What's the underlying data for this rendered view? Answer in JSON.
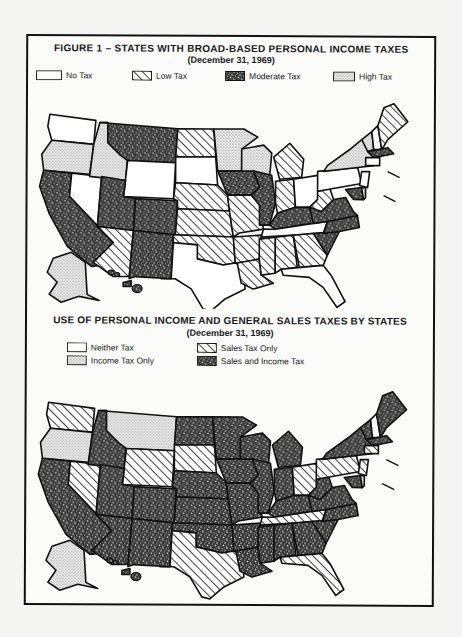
{
  "figure1": {
    "title": "FIGURE 1 – STATES WITH BROAD-BASED PERSONAL INCOME TAXES",
    "subtitle": "(December 31, 1969)",
    "legend": [
      {
        "key": "none",
        "label": "No Tax"
      },
      {
        "key": "low",
        "label": "Low Tax"
      },
      {
        "key": "moderate",
        "label": "Moderate Tax"
      },
      {
        "key": "high",
        "label": "High Tax"
      }
    ],
    "states": {
      "WA": "none",
      "OR": "high",
      "CA": "moderate",
      "NV": "none",
      "ID": "high",
      "MT": "moderate",
      "WY": "none",
      "UT": "moderate",
      "CO": "moderate",
      "AZ": "low",
      "NM": "moderate",
      "ND": "low",
      "SD": "none",
      "NE": "low",
      "KS": "low",
      "OK": "low",
      "TX": "none",
      "MN": "high",
      "IA": "moderate",
      "MO": "low",
      "AR": "low",
      "LA": "low",
      "WI": "high",
      "IL": "moderate",
      "MI": "low",
      "IN": "low",
      "OH": "none",
      "KY": "moderate",
      "TN": "none",
      "MS": "low",
      "AL": "low",
      "GA": "low",
      "FL": "none",
      "SC": "moderate",
      "NC": "moderate",
      "VA": "moderate",
      "WV": "low",
      "PA": "none",
      "NY": "high",
      "VT": "high",
      "NH": "none",
      "ME": "low",
      "MA": "moderate",
      "CT": "none",
      "NJ": "none",
      "DE": "high",
      "MD": "moderate",
      "AK": "high",
      "HI": "moderate"
    }
  },
  "figure2": {
    "title": "USE OF PERSONAL INCOME AND GENERAL SALES TAXES BY STATES",
    "subtitle": "(December 31, 1969)",
    "legend": [
      {
        "key": "none",
        "label": "Neither Tax"
      },
      {
        "key": "income",
        "label": "Income Tax Only"
      },
      {
        "key": "sales",
        "label": "Sales Tax Only"
      },
      {
        "key": "both",
        "label": "Sales and Income Tax"
      }
    ],
    "states": {
      "WA": "sales",
      "OR": "income",
      "CA": "both",
      "NV": "sales",
      "ID": "both",
      "MT": "income",
      "WY": "sales",
      "UT": "both",
      "CO": "both",
      "AZ": "both",
      "NM": "both",
      "ND": "both",
      "SD": "sales",
      "NE": "both",
      "KS": "both",
      "OK": "both",
      "TX": "sales",
      "MN": "both",
      "IA": "both",
      "MO": "both",
      "AR": "both",
      "LA": "both",
      "WI": "both",
      "IL": "both",
      "MI": "both",
      "IN": "both",
      "OH": "sales",
      "KY": "both",
      "TN": "sales",
      "MS": "both",
      "AL": "both",
      "GA": "both",
      "FL": "sales",
      "SC": "both",
      "NC": "both",
      "VA": "both",
      "WV": "both",
      "PA": "sales",
      "NY": "both",
      "VT": "both",
      "NH": "none",
      "ME": "both",
      "MA": "both",
      "CT": "sales",
      "NJ": "sales",
      "DE": "income",
      "MD": "both",
      "AK": "income",
      "HI": "both"
    }
  }
}
